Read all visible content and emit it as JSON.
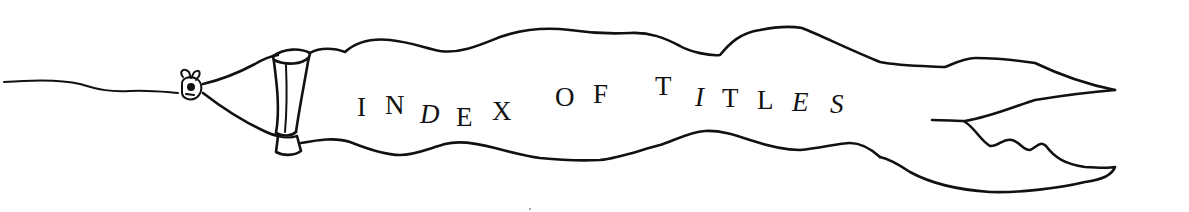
{
  "banner": {
    "title": "INDEX OF TITLES",
    "ink_color": "#111111",
    "paper_color": "#ffffff",
    "letters": [
      {
        "ch": "I",
        "x": 357,
        "y": 116,
        "italic": false
      },
      {
        "ch": "N",
        "x": 385,
        "y": 114,
        "italic": false
      },
      {
        "ch": "D",
        "x": 420,
        "y": 123,
        "italic": true
      },
      {
        "ch": "E",
        "x": 456,
        "y": 126,
        "italic": false
      },
      {
        "ch": "X",
        "x": 492,
        "y": 120,
        "italic": false
      },
      {
        "ch": "O",
        "x": 555,
        "y": 106,
        "italic": false
      },
      {
        "ch": "F",
        "x": 593,
        "y": 103,
        "italic": false
      },
      {
        "ch": "T",
        "x": 655,
        "y": 95,
        "italic": false
      },
      {
        "ch": "I",
        "x": 695,
        "y": 106,
        "italic": true
      },
      {
        "ch": "T",
        "x": 722,
        "y": 107,
        "italic": false
      },
      {
        "ch": "L",
        "x": 757,
        "y": 109,
        "italic": false
      },
      {
        "ch": "E",
        "x": 792,
        "y": 111,
        "italic": true
      },
      {
        "ch": "S",
        "x": 830,
        "y": 113,
        "italic": true
      }
    ]
  },
  "icons": {
    "ribbon": "ribbon-banner-icon",
    "knot": "knot-icon",
    "ferrule": "ferrule-band-icon",
    "string": "string-icon"
  }
}
